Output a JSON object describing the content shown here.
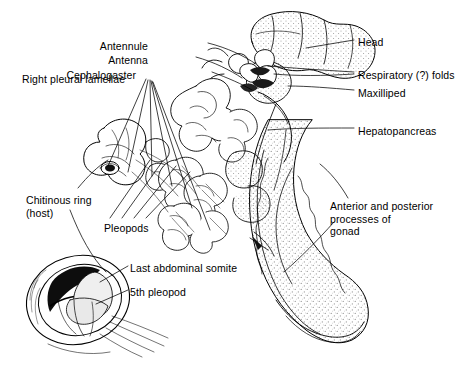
{
  "figure": {
    "kind": "anatomical-line-drawing",
    "background_color": "#ffffff",
    "ink_color": "#000000",
    "stipple_color": "#7a7a7a"
  },
  "labels": [
    {
      "id": "antennule",
      "text": "Antennule",
      "x": 148,
      "y": 40,
      "align": "right",
      "width": 80
    },
    {
      "id": "antenna",
      "text": "Antenna",
      "x": 148,
      "y": 54,
      "align": "right",
      "width": 80
    },
    {
      "id": "cephalogaster",
      "text": "Cephalogaster",
      "x": 136,
      "y": 69,
      "align": "right",
      "width": 92
    },
    {
      "id": "right-pleural-lamellae",
      "text": "Right pleural lamellae",
      "x": 22,
      "y": 73,
      "align": "left",
      "width": 124
    },
    {
      "id": "head",
      "text": "Head",
      "x": 358,
      "y": 36,
      "align": "left",
      "width": 60
    },
    {
      "id": "respiratory-folds",
      "text": "Respiratory (?) folds",
      "x": 358,
      "y": 69,
      "align": "left",
      "width": 112
    },
    {
      "id": "maxilliped",
      "text": "Maxilliped",
      "x": 358,
      "y": 87,
      "align": "left",
      "width": 70
    },
    {
      "id": "hepatopancreas",
      "text": "Hepatopancreas",
      "x": 358,
      "y": 125,
      "align": "left",
      "width": 94
    },
    {
      "id": "chitinous-ring",
      "text": "Chitinous ring\n(host)",
      "x": 26,
      "y": 194,
      "align": "left",
      "width": 90
    },
    {
      "id": "pleopods",
      "text": "Pleopods",
      "x": 104,
      "y": 222,
      "align": "left",
      "width": 60
    },
    {
      "id": "gonad-processes",
      "text": "Anterior and posterior\nprocesses of\ngonad",
      "x": 330,
      "y": 200,
      "align": "left",
      "width": 122
    },
    {
      "id": "last-abdominal-somite",
      "text": "Last abdominal somite",
      "x": 130,
      "y": 262,
      "align": "left",
      "width": 120
    },
    {
      "id": "fifth-pleopod",
      "text": "5th pleopod",
      "x": 130,
      "y": 286,
      "align": "left",
      "width": 80
    }
  ]
}
